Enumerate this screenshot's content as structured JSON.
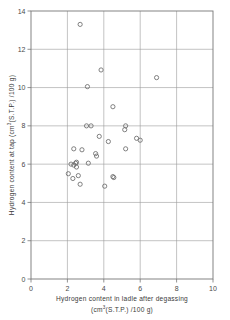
{
  "chart_data": {
    "type": "scatter",
    "title": "",
    "xlabel": "Hydrogen content in ladle after degassing (cm3(S.T.P.) /100 g)",
    "xlabel_line1": "Hydrogen content in ladle after degassing",
    "xlabel_line2_pre": "(cm",
    "xlabel_line2_sup": "3",
    "xlabel_line2_post": "(S.T.P.) /100 g)",
    "ylabel": "Hydrogen content at tap (cm3(S.T.P.) /100 g)",
    "ylabel_pre": "Hydrogen content at tap  (cm",
    "ylabel_sup": "3",
    "ylabel_post": "(S.T.P.) /100 g)",
    "xlim": [
      0,
      10
    ],
    "ylim": [
      0,
      14
    ],
    "xticks": [
      0,
      2,
      4,
      6,
      8,
      10
    ],
    "yticks": [
      0,
      2,
      4,
      6,
      8,
      10,
      12,
      14
    ],
    "xtick_labels": [
      "0",
      "2",
      "4",
      "6",
      "8",
      "10"
    ],
    "ytick_labels": [
      "0",
      "2",
      "4",
      "6",
      "8",
      "10",
      "12",
      "14"
    ],
    "grid": true,
    "grid_color": "#9a9a9a",
    "marker_style": "open-circle",
    "marker_color": "#6b6b6b",
    "marker_radius_px": 2.1,
    "legend": null,
    "points": [
      {
        "x": 2.7,
        "y": 13.3
      },
      {
        "x": 3.85,
        "y": 10.92
      },
      {
        "x": 6.9,
        "y": 10.52
      },
      {
        "x": 3.1,
        "y": 10.05
      },
      {
        "x": 4.5,
        "y": 9.0
      },
      {
        "x": 3.05,
        "y": 8.0
      },
      {
        "x": 3.3,
        "y": 8.0
      },
      {
        "x": 5.2,
        "y": 8.0
      },
      {
        "x": 5.15,
        "y": 7.8
      },
      {
        "x": 3.75,
        "y": 7.45
      },
      {
        "x": 5.8,
        "y": 7.35
      },
      {
        "x": 6.0,
        "y": 7.25
      },
      {
        "x": 4.25,
        "y": 7.18
      },
      {
        "x": 2.35,
        "y": 6.8
      },
      {
        "x": 5.2,
        "y": 6.8
      },
      {
        "x": 2.8,
        "y": 6.75
      },
      {
        "x": 3.55,
        "y": 6.55
      },
      {
        "x": 3.6,
        "y": 6.42
      },
      {
        "x": 3.15,
        "y": 6.05
      },
      {
        "x": 2.45,
        "y": 6.05
      },
      {
        "x": 2.5,
        "y": 6.1
      },
      {
        "x": 2.2,
        "y": 6.0
      },
      {
        "x": 2.35,
        "y": 5.95
      },
      {
        "x": 2.5,
        "y": 5.85
      },
      {
        "x": 2.05,
        "y": 5.5
      },
      {
        "x": 2.6,
        "y": 5.4
      },
      {
        "x": 2.3,
        "y": 5.25
      },
      {
        "x": 4.5,
        "y": 5.35
      },
      {
        "x": 4.55,
        "y": 5.3
      },
      {
        "x": 2.7,
        "y": 4.95
      },
      {
        "x": 4.05,
        "y": 4.85
      }
    ]
  },
  "axes": {
    "x_axis_name": "x-axis",
    "y_axis_name": "y-axis"
  }
}
